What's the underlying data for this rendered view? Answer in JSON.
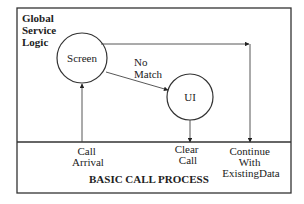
{
  "region_top": {
    "title_lines": [
      "Global",
      "Service",
      "Logic"
    ]
  },
  "region_bottom": {
    "title": "BASIC CALL PROCESS"
  },
  "nodes": {
    "screen": {
      "label": "Screen"
    },
    "ui": {
      "label": "UI"
    }
  },
  "edges": {
    "no_match": {
      "label_lines": [
        "No",
        "Match"
      ]
    }
  },
  "events": {
    "call_arrival": {
      "label_lines": [
        "Call",
        "Arrival"
      ]
    },
    "clear_call": {
      "label_lines": [
        "Clear",
        "Call"
      ]
    },
    "continue": {
      "label_lines": [
        "Continue",
        "With",
        "ExistingData"
      ]
    }
  },
  "colors": {
    "stroke": "#333333",
    "text": "#222222",
    "background": "#ffffff"
  }
}
